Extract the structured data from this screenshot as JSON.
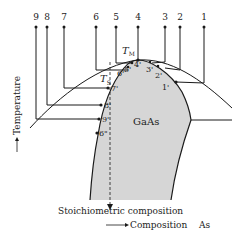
{
  "diagram": {
    "region_label": "GaAs",
    "tm_label": "T",
    "tm_sub": "M",
    "ts_label": "T",
    "ts_sub": "S",
    "y_axis_label": "Temperature",
    "x_axis_label": "Composition",
    "x_axis_element": "As",
    "stoich_label": "Stoichiometric composition",
    "top_labels": [
      "9",
      "8",
      "7",
      "6",
      "5",
      "4",
      "3",
      "2",
      "1"
    ],
    "solidus_labels": [
      "1'",
      "2'",
      "3'",
      "4'",
      "5'",
      "6'",
      "7'",
      "8'",
      "9'",
      "6\""
    ],
    "colors": {
      "region_fill": "#d6d6d6",
      "line": "#1a1a1a"
    }
  }
}
